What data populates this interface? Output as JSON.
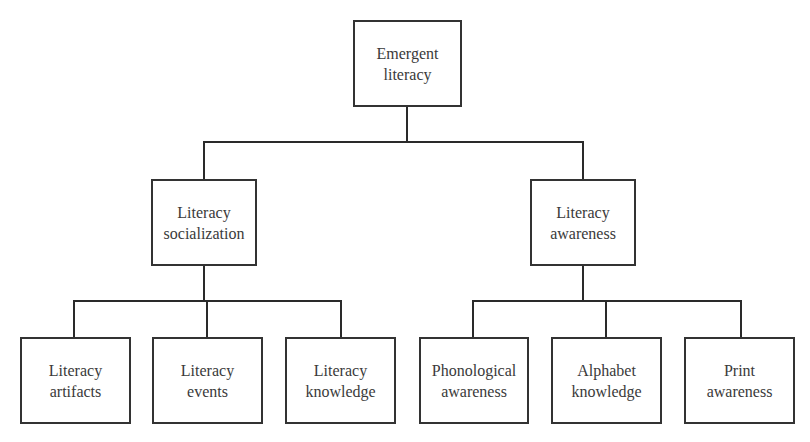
{
  "diagram": {
    "type": "hierarchy-tree",
    "root": {
      "line1": "Emergent",
      "line2": "literacy"
    },
    "level2": [
      {
        "line1": "Literacy",
        "line2": "socialization"
      },
      {
        "line1": "Literacy",
        "line2": "awareness"
      }
    ],
    "level3_left": [
      {
        "line1": "Literacy",
        "line2": "artifacts"
      },
      {
        "line1": "Literacy",
        "line2": "events"
      },
      {
        "line1": "Literacy",
        "line2": "knowledge"
      }
    ],
    "level3_right": [
      {
        "line1": "Phonological",
        "line2": "awareness"
      },
      {
        "line1": "Alphabet",
        "line2": "knowledge"
      },
      {
        "line1": "Print",
        "line2": "awareness"
      }
    ]
  },
  "colors": {
    "line": "#2a2a2a",
    "border": "#333333",
    "text": "#3a3a3a"
  }
}
